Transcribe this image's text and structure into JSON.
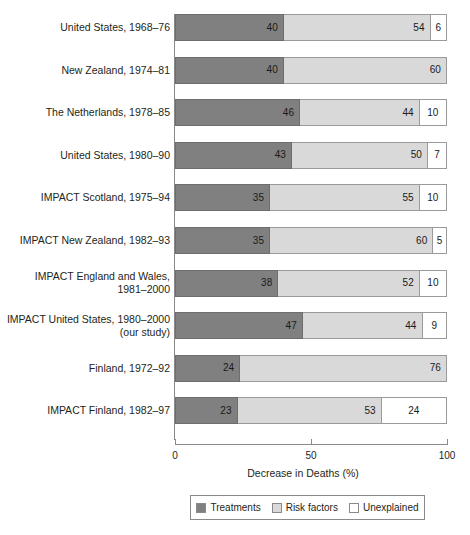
{
  "chart_data": {
    "type": "bar",
    "orientation": "horizontal",
    "stacked": true,
    "title": "",
    "xlabel": "Decrease in Deaths (%)",
    "ylabel": "",
    "xlim": [
      0,
      100
    ],
    "xticks": [
      0,
      50,
      100
    ],
    "xtick_labels": [
      "0",
      "50",
      "100"
    ],
    "grid": false,
    "legend_position": "bottom",
    "categories": [
      "United States, 1968–76",
      "New Zealand, 1974–81",
      "The Netherlands, 1978–85",
      "United States, 1980–90",
      "IMPACT Scotland, 1975–94",
      "IMPACT New Zealand, 1982–93",
      "IMPACT England and Wales,\n1981–2000",
      "IMPACT United States, 1980–2000\n(our study)",
      "Finland, 1972–92",
      "IMPACT Finland, 1982–97"
    ],
    "series": [
      {
        "name": "Treatments",
        "color": "#808080",
        "values": [
          40,
          40,
          46,
          43,
          35,
          35,
          38,
          47,
          24,
          23
        ],
        "labels": [
          "40",
          "40",
          "46",
          "43",
          "35",
          "35",
          "38",
          "47",
          "24",
          "23"
        ]
      },
      {
        "name": "Risk factors",
        "color": "#d9d9d9",
        "values": [
          54,
          60,
          44,
          50,
          55,
          60,
          52,
          44,
          76,
          53
        ],
        "labels": [
          "54",
          "60",
          "44",
          "50",
          "55",
          "60",
          "52",
          "44",
          "76",
          "53"
        ]
      },
      {
        "name": "Unexplained",
        "color": "#ffffff",
        "values": [
          6,
          0,
          10,
          7,
          10,
          5,
          10,
          9,
          0,
          24
        ],
        "labels": [
          "6",
          "",
          "10",
          "7",
          "10",
          "5",
          "10",
          "9",
          "",
          "24"
        ]
      }
    ]
  },
  "legend": {
    "items": [
      {
        "label": "Treatments"
      },
      {
        "label": "Risk factors"
      },
      {
        "label": "Unexplained"
      }
    ]
  }
}
